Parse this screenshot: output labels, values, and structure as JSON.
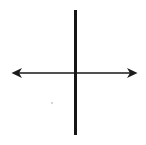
{
  "figure": {
    "name": "axes-cross-diagram",
    "background_color": "#ffffff",
    "vertical_line_color": "#161616",
    "horizontal_line_color": "#515151",
    "arrowhead_color": "#1c1c1c",
    "artifact_color": "#d9d5cf"
  }
}
